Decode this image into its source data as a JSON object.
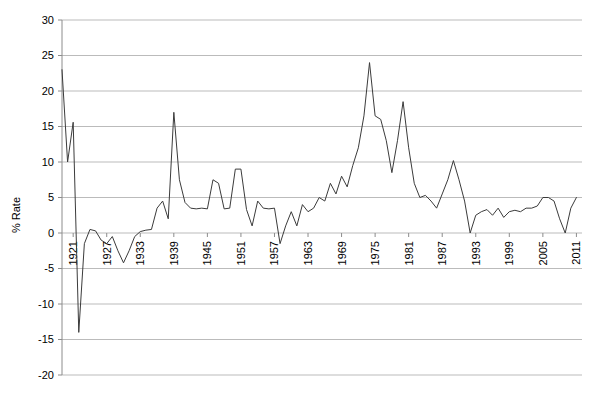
{
  "chart_data": {
    "type": "line",
    "title": "",
    "subtitle": "",
    "xlabel": "",
    "ylabel": "% Rate",
    "ylim": [
      -20,
      30
    ],
    "xlim": [
      1919,
      2012
    ],
    "grid": true,
    "legend": false,
    "legend_position": "none",
    "y_ticks": [
      30,
      25,
      20,
      15,
      10,
      5,
      0,
      -5,
      -10,
      -15,
      -20
    ],
    "y_tick_labels": [
      "30",
      "25",
      "20",
      "15",
      "10",
      "5",
      "0",
      "-5",
      "-10",
      "-15",
      "-20"
    ],
    "x_tick_labels": [
      "1921",
      "1927",
      "1933",
      "1939",
      "1945",
      "1951",
      "1957",
      "1963",
      "1969",
      "1975",
      "1981",
      "1987",
      "1993",
      "1999",
      "2005",
      "2011"
    ],
    "x_tick_values": [
      1921,
      1927,
      1933,
      1939,
      1945,
      1951,
      1957,
      1963,
      1969,
      1975,
      1981,
      1987,
      1993,
      1999,
      2005,
      2011
    ],
    "x_tick_rotation": -90,
    "series": [
      {
        "name": "% Rate",
        "color": "#3b3b3b",
        "x": [
          1919,
          1920,
          1921,
          1922,
          1923,
          1924,
          1925,
          1926,
          1927,
          1928,
          1929,
          1930,
          1931,
          1932,
          1933,
          1934,
          1935,
          1936,
          1937,
          1938,
          1939,
          1940,
          1941,
          1942,
          1943,
          1944,
          1945,
          1946,
          1947,
          1948,
          1949,
          1950,
          1951,
          1952,
          1953,
          1954,
          1955,
          1956,
          1957,
          1958,
          1959,
          1960,
          1961,
          1962,
          1963,
          1964,
          1965,
          1966,
          1967,
          1968,
          1969,
          1970,
          1971,
          1972,
          1973,
          1974,
          1975,
          1976,
          1977,
          1978,
          1979,
          1980,
          1981,
          1982,
          1983,
          1984,
          1985,
          1986,
          1987,
          1988,
          1989,
          1990,
          1991,
          1992,
          1993,
          1994,
          1995,
          1996,
          1997,
          1998,
          1999,
          2000,
          2001,
          2002,
          2003,
          2004,
          2005,
          2006,
          2007,
          2008,
          2009,
          2010,
          2011
        ],
        "values": [
          23.0,
          10.0,
          15.6,
          -14.0,
          -1.5,
          0.5,
          0.3,
          -1.0,
          -1.5,
          -0.5,
          -2.5,
          -4.2,
          -2.5,
          -0.5,
          0.2,
          0.4,
          0.5,
          3.5,
          4.5,
          2.0,
          17.0,
          7.5,
          4.3,
          3.5,
          3.4,
          3.5,
          3.4,
          7.5,
          7.0,
          3.4,
          3.5,
          9.0,
          9.0,
          3.3,
          1.0,
          4.5,
          3.5,
          3.4,
          3.5,
          -1.5,
          1.0,
          3.0,
          1.0,
          4.0,
          3.0,
          3.5,
          5.0,
          4.5,
          7.0,
          5.5,
          8.0,
          6.5,
          9.5,
          12.0,
          16.5,
          24.0,
          16.5,
          16.0,
          13.0,
          8.5,
          13.0,
          18.5,
          12.0,
          7.0,
          5.0,
          5.3,
          4.5,
          3.5,
          5.5,
          7.5,
          10.2,
          7.5,
          4.5,
          0.0,
          2.5,
          3.0,
          3.3,
          2.5,
          3.5,
          2.2,
          3.0,
          3.2,
          3.0,
          3.5,
          3.5,
          3.8,
          5.0,
          5.0,
          4.5,
          2.0,
          0.0,
          3.5,
          5.0
        ]
      }
    ]
  }
}
